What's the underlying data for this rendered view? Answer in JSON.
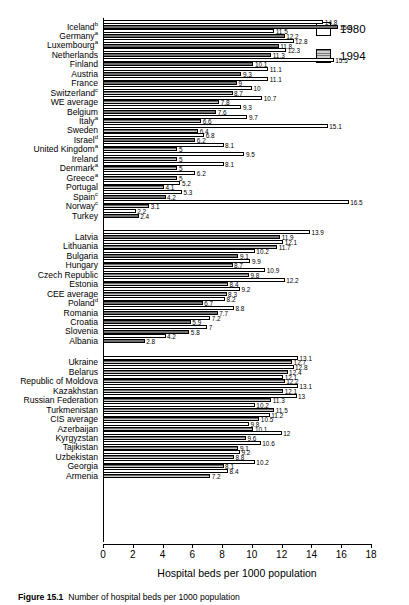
{
  "chart_data": {
    "type": "bar",
    "orientation": "horizontal",
    "title": "",
    "xlabel": "Hospital beds per 1000 population",
    "ylabel": "",
    "xlim": [
      0,
      18
    ],
    "xticks": [
      0,
      2,
      4,
      6,
      8,
      10,
      12,
      14,
      16,
      18
    ],
    "grid": false,
    "legend_position": "top-right",
    "series": [
      {
        "name": "1980",
        "color": "#ffffff"
      },
      {
        "name": "1994",
        "color": "#a8a8a8"
      }
    ],
    "groups": [
      {
        "name": "Western Europe",
        "categories": [
          {
            "label": "Iceland",
            "note": "b",
            "v1980": 14.8,
            "v1994": 15.8
          },
          {
            "label": "Germany",
            "note": "a",
            "v1980": 11.5,
            "v1994": 12.2
          },
          {
            "label": "Luxembourg",
            "note": "a",
            "v1980": 12.8,
            "v1994": 11.8
          },
          {
            "label": "Netherlands",
            "note": "",
            "v1980": 12.3,
            "v1994": 11.3
          },
          {
            "label": "Finland",
            "note": "",
            "v1980": 15.5,
            "v1994": 10.1
          },
          {
            "label": "Austria",
            "note": "",
            "v1980": 11.1,
            "v1994": 9.3
          },
          {
            "label": "France",
            "note": "",
            "v1980": 11.1,
            "v1994": 9.0
          },
          {
            "label": "Switzerland",
            "note": "c",
            "v1980": 10.0,
            "v1994": 8.7
          },
          {
            "label": "WE average",
            "note": "",
            "v1980": 10.7,
            "v1994": 7.8
          },
          {
            "label": "Belgium",
            "note": "",
            "v1980": 9.3,
            "v1994": 7.6
          },
          {
            "label": "Italy",
            "note": "a",
            "v1980": 9.7,
            "v1994": 6.6
          },
          {
            "label": "Sweden",
            "note": "",
            "v1980": 15.1,
            "v1994": 6.4
          },
          {
            "label": "Israel",
            "note": "d",
            "v1980": 6.8,
            "v1994": 6.2
          },
          {
            "label": "United Kingdom",
            "note": "a",
            "v1980": 8.1,
            "v1994": 5.0
          },
          {
            "label": "Ireland",
            "note": "",
            "v1980": 9.5,
            "v1994": 5.0
          },
          {
            "label": "Denmark",
            "note": "a",
            "v1980": 8.1,
            "v1994": 5.0
          },
          {
            "label": "Greece",
            "note": "a",
            "v1980": 6.2,
            "v1994": 5.0
          },
          {
            "label": "Portugal",
            "note": "",
            "v1980": 5.2,
            "v1994": 4.1
          },
          {
            "label": "Spain",
            "note": "c",
            "v1980": 5.3,
            "v1994": 4.2
          },
          {
            "label": "Norway",
            "note": "c",
            "v1980": 16.5,
            "v1994": 3.1
          },
          {
            "label": "Turkey",
            "note": "",
            "v1980": 2.2,
            "v1994": 2.4
          }
        ]
      },
      {
        "name": "Central and Eastern Europe",
        "categories": [
          {
            "label": "Latvia",
            "note": "",
            "v1980": 13.9,
            "v1994": 11.9
          },
          {
            "label": "Lithuania",
            "note": "",
            "v1980": 12.1,
            "v1994": 11.7
          },
          {
            "label": "Bulgaria",
            "note": "",
            "v1980": 10.2,
            "v1994": 9.1
          },
          {
            "label": "Hungary",
            "note": "",
            "v1980": 9.9,
            "v1994": 8.7
          },
          {
            "label": "Czech Republic",
            "note": "",
            "v1980": 10.9,
            "v1994": 9.8
          },
          {
            "label": "Estonia",
            "note": "",
            "v1980": 12.2,
            "v1994": 8.4
          },
          {
            "label": "CEE average",
            "note": "",
            "v1980": 9.2,
            "v1994": 8.3
          },
          {
            "label": "Poland",
            "note": "d",
            "v1980": 8.2,
            "v1994": 6.7
          },
          {
            "label": "Romania",
            "note": "",
            "v1980": 8.8,
            "v1994": 7.7
          },
          {
            "label": "Croatia",
            "note": "",
            "v1980": 7.2,
            "v1994": 5.9
          },
          {
            "label": "Slovenia",
            "note": "",
            "v1980": 7.0,
            "v1994": 5.8
          },
          {
            "label": "Albania",
            "note": "",
            "v1980": 4.2,
            "v1994": 2.8
          }
        ]
      },
      {
        "name": "CIS",
        "categories": [
          {
            "label": "Ukraine",
            "note": "",
            "v1980": 13.1,
            "v1994": 12.7
          },
          {
            "label": "Belarus",
            "note": "",
            "v1980": 12.8,
            "v1994": 12.4
          },
          {
            "label": "Republic of Moldova",
            "note": "",
            "v1980": 12.1,
            "v1994": 12.2
          },
          {
            "label": "Kazakhstan",
            "note": "",
            "v1980": 13.1,
            "v1994": 12.1
          },
          {
            "label": "Russian Federation",
            "note": "",
            "v1980": 13.0,
            "v1994": 11.3
          },
          {
            "label": "Turkmenistan",
            "note": "",
            "v1980": 10.2,
            "v1994": 11.5
          },
          {
            "label": "CIS average",
            "note": "",
            "v1980": 11.2,
            "v1994": 10.5
          },
          {
            "label": "Azerbaijan",
            "note": "",
            "v1980": 9.8,
            "v1994": 10.1
          },
          {
            "label": "Kyrgyzstan",
            "note": "",
            "v1980": 12.0,
            "v1994": 9.6
          },
          {
            "label": "Tajikistan",
            "note": "",
            "v1980": 10.6,
            "v1994": 9.1
          },
          {
            "label": "Uzbekistan",
            "note": "",
            "v1980": 9.2,
            "v1994": 8.8
          },
          {
            "label": "Georgia",
            "note": "",
            "v1980": 10.2,
            "v1994": 8.1
          },
          {
            "label": "Armenia",
            "note": "",
            "v1980": 8.4,
            "v1994": 7.2
          }
        ]
      }
    ]
  },
  "legend": {
    "items": [
      {
        "label": "1980",
        "key": "y1980"
      },
      {
        "label": "1994",
        "key": "y1994"
      }
    ]
  },
  "axis": {
    "title": "Hospital beds per 1000 population",
    "ticks": [
      "0",
      "2",
      "4",
      "6",
      "8",
      "10",
      "12",
      "14",
      "16",
      "18"
    ]
  },
  "caption": {
    "prefix": "Figure",
    "number": "15.1",
    "text": "Number of hospital beds per 1000 population"
  }
}
